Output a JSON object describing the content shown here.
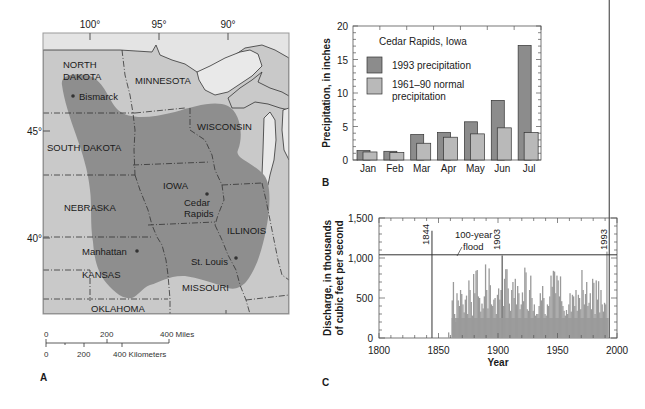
{
  "panels": {
    "a": {
      "letter": "A",
      "longitude_labels": [
        {
          "label": "100°",
          "x": 90
        },
        {
          "label": "95°",
          "x": 159
        },
        {
          "label": "90°",
          "x": 228
        }
      ],
      "latitude_labels": [
        {
          "label": "45°",
          "y": 131
        },
        {
          "label": "40°",
          "y": 238
        }
      ],
      "states": [
        {
          "label": "NORTH",
          "x": 63,
          "y": 68
        },
        {
          "label": "DAKOTA",
          "x": 63,
          "y": 80
        },
        {
          "label": "MINNESOTA",
          "x": 135,
          "y": 84
        },
        {
          "label": "WISCONSIN",
          "x": 197,
          "y": 130
        },
        {
          "label": "SOUTH DAKOTA",
          "x": 47,
          "y": 151
        },
        {
          "label": "IOWA",
          "x": 163,
          "y": 189
        },
        {
          "label": "NEBRASKA",
          "x": 64,
          "y": 211
        },
        {
          "label": "ILLINOIS",
          "x": 227,
          "y": 234
        },
        {
          "label": "KANSAS",
          "x": 82,
          "y": 278
        },
        {
          "label": "MISSOURI",
          "x": 182,
          "y": 291
        },
        {
          "label": "OKLAHOMA",
          "x": 91,
          "y": 312
        }
      ],
      "cities": [
        {
          "label": "Bismarck",
          "dot_x": 73,
          "dot_y": 96,
          "x": 79,
          "y": 100
        },
        {
          "label": "Cedar",
          "dot_x": 207,
          "dot_y": 194,
          "x": 184,
          "y": 206
        },
        {
          "label": "Rapids",
          "x": 184,
          "y": 217
        },
        {
          "label": "Manhattan",
          "dot_x": 137,
          "dot_y": 251,
          "x": 82,
          "y": 255
        },
        {
          "label": "St. Louis",
          "dot_x": 236,
          "dot_y": 258,
          "x": 191,
          "y": 265
        }
      ],
      "scale_bar": {
        "miles_labels": [
          "0",
          "200",
          "400 Miles"
        ],
        "km_labels": [
          "0",
          "200",
          "400 Kilometers"
        ]
      },
      "colors": {
        "canada": "#e4e4e4",
        "us": "#c9c9c9",
        "flooded": "#8e8e8e",
        "water": "#e9e9e9"
      }
    },
    "b": {
      "letter": "B"
    },
    "c": {
      "letter": "C"
    }
  },
  "chart_data": [
    {
      "id": "B",
      "type": "bar",
      "title": "Cedar Rapids, Iowa",
      "xlabel": "",
      "ylabel": "Precipitation, in inches",
      "ylim": [
        0,
        20
      ],
      "yticks": [
        0,
        5,
        10,
        15,
        20
      ],
      "grid": false,
      "legend_position": "upper left (inside)",
      "categories": [
        "Jan",
        "Feb",
        "Mar",
        "Apr",
        "May",
        "Jun",
        "Jul"
      ],
      "series": [
        {
          "name": "1993 precipitation",
          "color": "#8c8c8c",
          "values": [
            1.4,
            1.3,
            3.8,
            4.1,
            5.7,
            8.9,
            17.1
          ]
        },
        {
          "name": "1961–90 normal precipitation",
          "color": "#b9b9b9",
          "values": [
            1.2,
            1.1,
            2.5,
            3.4,
            3.9,
            4.8,
            4.1
          ]
        }
      ],
      "legend": [
        {
          "label_lines": [
            "1993 precipitation"
          ],
          "color": "#8c8c8c"
        },
        {
          "label_lines": [
            "1961–90 normal",
            "precipitation"
          ],
          "color": "#b9b9b9"
        }
      ]
    },
    {
      "id": "C",
      "type": "bar",
      "title": "",
      "xlabel": "Year",
      "ylabel_lines": [
        "Discharge, in thousands",
        "of cubic feet per second"
      ],
      "xlim": [
        1800,
        2000
      ],
      "ylim": [
        0,
        1500
      ],
      "xticks": [
        1800,
        1850,
        1900,
        1950,
        2000
      ],
      "yticks": [
        0,
        500,
        1000,
        1500
      ],
      "ytick_labels": [
        "0",
        "500",
        "1,000",
        "1,500"
      ],
      "grid": false,
      "series_color": "#9a9a9a",
      "reference_line": {
        "label_lines": [
          "100-year",
          "flood"
        ],
        "value": 1040
      },
      "annotations": [
        {
          "label": "1844",
          "year": 1844,
          "value": 1340
        },
        {
          "label": "1903",
          "year": 1903,
          "value": 1030
        },
        {
          "label": "1993",
          "year": 1993,
          "value": 1080
        }
      ],
      "x": [
        1844,
        1858,
        1861,
        1862,
        1863,
        1864,
        1865,
        1866,
        1867,
        1868,
        1869,
        1870,
        1871,
        1872,
        1873,
        1874,
        1875,
        1876,
        1877,
        1878,
        1879,
        1880,
        1881,
        1882,
        1883,
        1884,
        1885,
        1886,
        1887,
        1888,
        1889,
        1890,
        1891,
        1892,
        1893,
        1894,
        1895,
        1896,
        1897,
        1898,
        1899,
        1900,
        1901,
        1902,
        1903,
        1904,
        1905,
        1906,
        1907,
        1908,
        1909,
        1910,
        1911,
        1912,
        1913,
        1914,
        1915,
        1916,
        1917,
        1918,
        1919,
        1920,
        1921,
        1922,
        1923,
        1924,
        1925,
        1926,
        1927,
        1928,
        1929,
        1930,
        1931,
        1932,
        1933,
        1934,
        1935,
        1936,
        1937,
        1938,
        1939,
        1940,
        1941,
        1942,
        1943,
        1944,
        1945,
        1946,
        1947,
        1948,
        1949,
        1950,
        1951,
        1952,
        1953,
        1954,
        1955,
        1956,
        1957,
        1958,
        1959,
        1960,
        1961,
        1962,
        1963,
        1964,
        1965,
        1966,
        1967,
        1968,
        1969,
        1970,
        1971,
        1972,
        1973,
        1974,
        1975,
        1976,
        1977,
        1978,
        1979,
        1980,
        1981,
        1982,
        1983,
        1984,
        1985,
        1986,
        1987,
        1988,
        1989,
        1990,
        1991,
        1992,
        1993
      ],
      "values": [
        1340,
        70,
        470,
        700,
        300,
        200,
        560,
        470,
        400,
        600,
        550,
        420,
        320,
        480,
        530,
        300,
        720,
        600,
        450,
        280,
        800,
        560,
        840,
        850,
        520,
        500,
        330,
        430,
        370,
        520,
        920,
        600,
        370,
        870,
        660,
        420,
        400,
        480,
        500,
        300,
        540,
        620,
        480,
        600,
        1030,
        400,
        740,
        860,
        860,
        620,
        430,
        340,
        600,
        700,
        500,
        740,
        420,
        650,
        560,
        360,
        420,
        570,
        460,
        880,
        820,
        360,
        340,
        600,
        780,
        500,
        340,
        420,
        280,
        300,
        300,
        400,
        560,
        470,
        650,
        500,
        300,
        280,
        420,
        400,
        520,
        780,
        640,
        840,
        830,
        560,
        780,
        720,
        520,
        770,
        460,
        400,
        340,
        280,
        350,
        300,
        420,
        560,
        330,
        540,
        520,
        400,
        600,
        340,
        540,
        500,
        360,
        850,
        600,
        420,
        550,
        700,
        400,
        440,
        560,
        360,
        740,
        690,
        300,
        720,
        480,
        710,
        320,
        600,
        420,
        330,
        440,
        420,
        1080
      ]
    }
  ]
}
